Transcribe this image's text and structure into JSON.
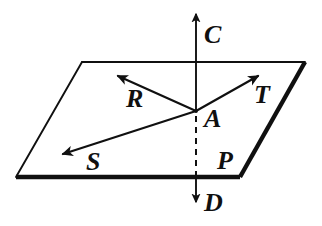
{
  "figure": {
    "kind": "geometry-diagram",
    "background_color": "#ffffff",
    "ink_color": "#101010",
    "labels": {
      "vertical_up": "C",
      "vertical_down": "D",
      "ray_upper_left": "R",
      "ray_lower_left": "S",
      "ray_upper_right": "T",
      "intersection_point": "A",
      "plane": "P"
    },
    "label_positions": {
      "C": {
        "x": 204,
        "y": 43
      },
      "D": {
        "x": 204,
        "y": 211
      },
      "R": {
        "x": 126,
        "y": 107
      },
      "S": {
        "x": 86,
        "y": 170
      },
      "T": {
        "x": 254,
        "y": 103
      },
      "A": {
        "x": 204,
        "y": 127
      },
      "P": {
        "x": 218,
        "y": 169
      }
    },
    "geometry": {
      "plane_vertices": [
        {
          "x": 82,
          "y": 62
        },
        {
          "x": 305,
          "y": 62
        },
        {
          "x": 240,
          "y": 177
        },
        {
          "x": 16,
          "y": 177
        }
      ],
      "point_A": {
        "x": 196,
        "y": 111
      },
      "axis_top_tip": {
        "x": 196,
        "y": 10
      },
      "axis_bottom_tip": {
        "x": 196,
        "y": 206
      },
      "axis_plane_entry": {
        "x": 196,
        "y": 62
      },
      "axis_plane_exit": {
        "x": 196,
        "y": 177
      },
      "ray_R_tip": {
        "x": 114,
        "y": 73
      },
      "ray_S_tip": {
        "x": 58,
        "y": 156
      },
      "ray_T_tip": {
        "x": 262,
        "y": 73
      }
    },
    "stroke_widths": {
      "thin": 1.6,
      "ray": 2.0,
      "bold_edge": 4.2,
      "dash_pattern": "6 5"
    }
  }
}
